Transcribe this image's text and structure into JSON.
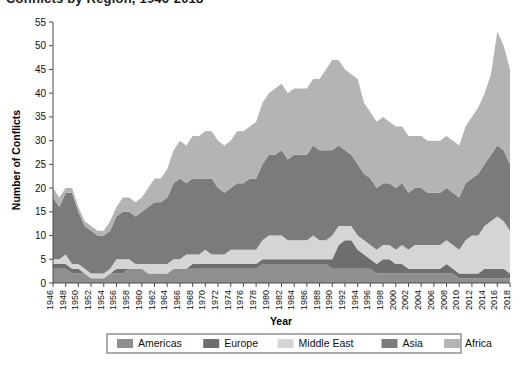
{
  "title": {
    "text": "Conflicts by Region, 1946-2018",
    "clipped": true
  },
  "axes": {
    "xlabel": "Year",
    "ylabel": "Number of Conflicts"
  },
  "legend": {
    "position": "bottom",
    "items": [
      {
        "label": "Americas",
        "color": "#8f8f8f"
      },
      {
        "label": "Europe",
        "color": "#6e6e6e"
      },
      {
        "label": "Middle East",
        "color": "#d5d5d5"
      },
      {
        "label": "Asia",
        "color": "#7b7b7b"
      },
      {
        "label": "Africa",
        "color": "#b4b4b4"
      }
    ]
  },
  "chart_data": {
    "type": "area",
    "stacked": true,
    "title": "Conflicts by Region, 1946-2018",
    "xlabel": "Year",
    "ylabel": "Number of Conflicts",
    "ylim": [
      0,
      55
    ],
    "ytick_step": 5,
    "yticks": [
      0,
      5,
      10,
      15,
      20,
      25,
      30,
      35,
      40,
      45,
      50,
      55
    ],
    "xlim": [
      1946,
      2018
    ],
    "xtick_step": 2,
    "grid": false,
    "legend_position": "bottom",
    "x": [
      1946,
      1947,
      1948,
      1949,
      1950,
      1951,
      1952,
      1953,
      1954,
      1955,
      1956,
      1957,
      1958,
      1959,
      1960,
      1961,
      1962,
      1963,
      1964,
      1965,
      1966,
      1967,
      1968,
      1969,
      1970,
      1971,
      1972,
      1973,
      1974,
      1975,
      1976,
      1977,
      1978,
      1979,
      1980,
      1981,
      1982,
      1983,
      1984,
      1985,
      1986,
      1987,
      1988,
      1989,
      1990,
      1991,
      1992,
      1993,
      1994,
      1995,
      1996,
      1997,
      1998,
      1999,
      2000,
      2001,
      2002,
      2003,
      2004,
      2005,
      2006,
      2007,
      2008,
      2009,
      2010,
      2011,
      2012,
      2013,
      2014,
      2015,
      2016,
      2017,
      2018
    ],
    "xticks": [
      1946,
      1948,
      1950,
      1952,
      1954,
      1956,
      1958,
      1960,
      1962,
      1964,
      1966,
      1968,
      1970,
      1972,
      1974,
      1976,
      1978,
      1980,
      1982,
      1984,
      1986,
      1988,
      1990,
      1992,
      1994,
      1996,
      1998,
      2000,
      2002,
      2004,
      2006,
      2008,
      2010,
      2012,
      2014,
      2016,
      2018
    ],
    "series": [
      {
        "name": "Americas",
        "color": "#8f8f8f",
        "values": [
          3,
          3,
          3,
          2,
          2,
          2,
          1,
          1,
          1,
          2,
          2,
          2,
          3,
          3,
          3,
          2,
          2,
          2,
          2,
          3,
          3,
          3,
          3,
          3,
          3,
          3,
          3,
          3,
          3,
          3,
          3,
          3,
          3,
          4,
          4,
          4,
          4,
          4,
          4,
          4,
          4,
          4,
          4,
          4,
          3,
          3,
          3,
          3,
          3,
          3,
          3,
          2,
          2,
          2,
          2,
          2,
          2,
          2,
          2,
          2,
          2,
          2,
          2,
          2,
          1,
          1,
          1,
          1,
          1,
          1,
          1,
          1,
          1
        ]
      },
      {
        "name": "Europe",
        "color": "#6e6e6e",
        "values": [
          1,
          1,
          1,
          1,
          1,
          0,
          0,
          0,
          0,
          0,
          1,
          1,
          0,
          0,
          0,
          0,
          0,
          0,
          0,
          0,
          0,
          0,
          1,
          1,
          1,
          1,
          1,
          1,
          1,
          1,
          1,
          1,
          1,
          1,
          1,
          1,
          1,
          1,
          1,
          1,
          1,
          1,
          1,
          1,
          2,
          5,
          6,
          6,
          4,
          3,
          2,
          2,
          3,
          3,
          2,
          2,
          1,
          1,
          1,
          1,
          1,
          1,
          2,
          1,
          1,
          1,
          1,
          1,
          2,
          2,
          2,
          2,
          1
        ]
      },
      {
        "name": "Middle East",
        "color": "#d5d5d5",
        "values": [
          1,
          1,
          2,
          1,
          1,
          1,
          1,
          1,
          1,
          1,
          2,
          2,
          2,
          1,
          1,
          2,
          2,
          2,
          2,
          2,
          2,
          3,
          2,
          2,
          3,
          2,
          2,
          2,
          3,
          3,
          3,
          3,
          3,
          4,
          5,
          5,
          5,
          4,
          4,
          4,
          4,
          5,
          4,
          4,
          5,
          4,
          3,
          3,
          3,
          3,
          3,
          3,
          3,
          3,
          3,
          4,
          4,
          5,
          5,
          5,
          5,
          5,
          5,
          5,
          5,
          7,
          8,
          8,
          9,
          10,
          11,
          10,
          9
        ]
      },
      {
        "name": "Asia",
        "color": "#7b7b7b",
        "values": [
          13,
          11,
          13,
          15,
          11,
          9,
          9,
          8,
          8,
          8,
          9,
          10,
          10,
          10,
          11,
          12,
          13,
          13,
          14,
          16,
          17,
          15,
          16,
          16,
          15,
          16,
          14,
          13,
          13,
          14,
          14,
          15,
          15,
          16,
          17,
          17,
          18,
          17,
          18,
          18,
          18,
          19,
          19,
          19,
          18,
          17,
          16,
          15,
          15,
          14,
          14,
          13,
          13,
          13,
          13,
          13,
          12,
          12,
          12,
          11,
          11,
          11,
          11,
          11,
          11,
          12,
          12,
          13,
          13,
          14,
          15,
          15,
          14
        ]
      },
      {
        "name": "Africa",
        "color": "#b4b4b4",
        "values": [
          2,
          2,
          1,
          1,
          1,
          1,
          1,
          1,
          1,
          2,
          2,
          3,
          3,
          3,
          3,
          4,
          5,
          5,
          6,
          7,
          8,
          8,
          9,
          9,
          10,
          10,
          10,
          10,
          10,
          11,
          11,
          11,
          12,
          13,
          13,
          14,
          14,
          14,
          14,
          14,
          14,
          14,
          15,
          17,
          19,
          18,
          17,
          17,
          18,
          15,
          14,
          14,
          14,
          13,
          13,
          12,
          12,
          11,
          11,
          11,
          11,
          11,
          11,
          11,
          11,
          12,
          13,
          14,
          15,
          17,
          24,
          22,
          20
        ]
      }
    ],
    "totals_note": "Stacked totals peak near 53 around 2016 and near 51 around 1991-1992"
  }
}
